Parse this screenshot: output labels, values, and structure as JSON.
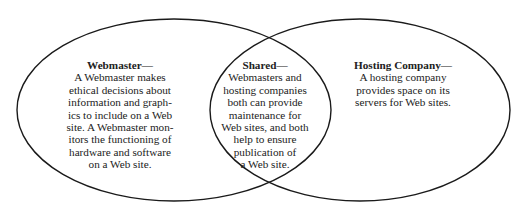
{
  "diagram": {
    "type": "venn",
    "stroke_color": "#1a1a1a",
    "background": "#ffffff",
    "sets": [
      {
        "id": "webmaster",
        "title": "Webmaster—",
        "lines": [
          "A Webmaster makes",
          "ethical decisions about",
          "information and graph-",
          "ics to include on a Web",
          "site. A Webmaster mon-",
          "itors the functioning of",
          "hardware and software",
          "on a Web site."
        ]
      },
      {
        "id": "shared",
        "title": "Shared—",
        "lines": [
          "Webmasters and",
          "hosting companies",
          "both can provide",
          "maintenance for",
          "Web sites, and both",
          "help to ensure",
          "publication of",
          "a Web site."
        ]
      },
      {
        "id": "hosting",
        "title": "Hosting Company—",
        "lines": [
          "A hosting company",
          "provides space on its",
          "servers for Web sites."
        ]
      }
    ]
  }
}
